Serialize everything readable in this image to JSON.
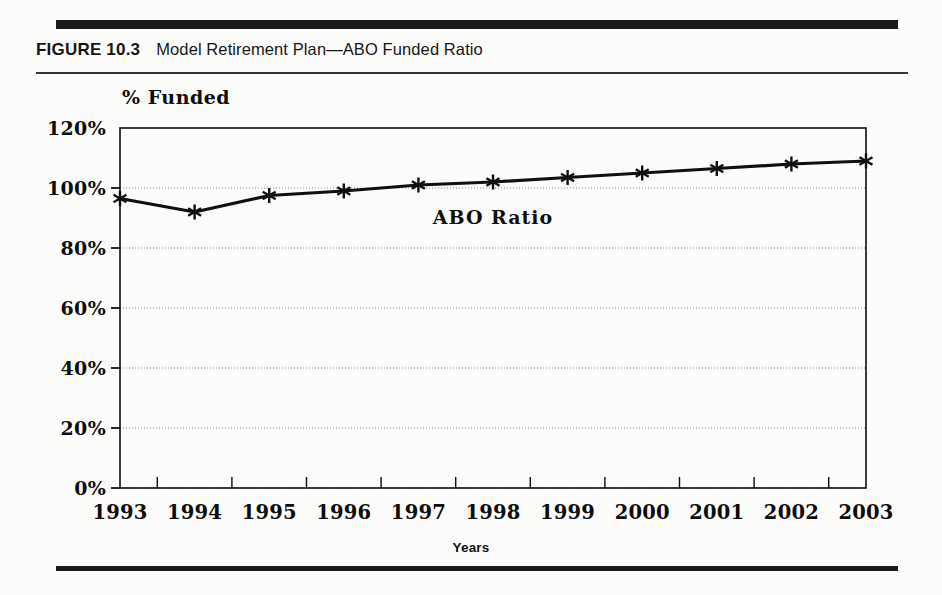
{
  "figure": {
    "label": "FIGURE 10.3",
    "title": "Model Retirement Plan—ABO Funded Ratio"
  },
  "colors": {
    "ink": "#0d0d0d",
    "rule": "#1a1a1a",
    "grid": "#8c8c8c",
    "series": "#101010",
    "page": "#fcfcfa"
  },
  "chart_data": {
    "type": "line",
    "title": "Model Retirement Plan—ABO Funded Ratio",
    "xlabel": "Years",
    "ylabel": "% Funded",
    "categories": [
      "1993",
      "1994",
      "1995",
      "1996",
      "1997",
      "1998",
      "1999",
      "2000",
      "2001",
      "2002",
      "2003"
    ],
    "series": [
      {
        "name": "ABO Ratio",
        "values": [
          96.5,
          92,
          97.5,
          99,
          101,
          102,
          103.5,
          105,
          106.5,
          108,
          109
        ]
      }
    ],
    "ylim": [
      0,
      120
    ],
    "yticks": [
      0,
      20,
      40,
      60,
      80,
      100,
      120
    ],
    "ytick_labels": [
      "0%",
      "20%",
      "40%",
      "60%",
      "80%",
      "100%",
      "120%"
    ],
    "grid": true,
    "grid_axis": "y",
    "legend": false,
    "annotations": [
      {
        "text": "ABO Ratio",
        "x_category": "1998",
        "y_value": 88
      }
    ],
    "marker": "asterisk",
    "value_unit": "percent"
  }
}
